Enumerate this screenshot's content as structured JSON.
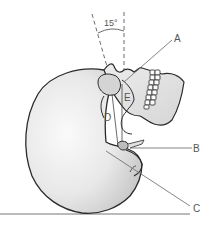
{
  "diagram": {
    "angle_label": "15°",
    "labels": {
      "A": "A",
      "B": "B",
      "C": "C",
      "D": "D",
      "E": "E"
    },
    "colors": {
      "outline": "#2a2a2a",
      "fill": "#e6e6e6",
      "shade": "#cfcfcf",
      "leader": "#666666",
      "label": "#555555"
    }
  }
}
